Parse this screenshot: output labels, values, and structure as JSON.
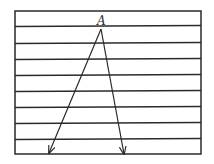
{
  "diagram": {
    "type": "geometry-figure",
    "colors": {
      "background": "#ffffff",
      "stroke": "#2a2a2a"
    },
    "frame": {
      "x1": 15,
      "y1": 11,
      "x2": 201,
      "y2": 154
    },
    "horizontal_lines_y": [
      26,
      43,
      59,
      75,
      91,
      107,
      123,
      139
    ],
    "point": {
      "label": "A",
      "x": 101,
      "y": 29,
      "label_x": 97,
      "label_y": 25
    },
    "rays": [
      {
        "name": "left-ray",
        "from": [
          101,
          29
        ],
        "to": [
          49,
          153
        ]
      },
      {
        "name": "right-ray",
        "from": [
          101,
          29
        ],
        "to": [
          124,
          154
        ]
      }
    ]
  }
}
